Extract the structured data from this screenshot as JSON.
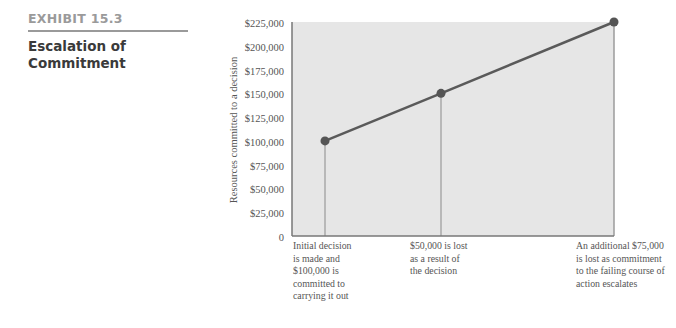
{
  "exhibit": {
    "label": "EXHIBIT 15.3",
    "title_line1": "Escalation of",
    "title_line2": "Commitment"
  },
  "chart_data": {
    "type": "line",
    "title": "Escalation of Commitment",
    "xlabel": "",
    "ylabel": "Resources committed to a decision",
    "ylim": [
      0,
      225000
    ],
    "yticks": [
      {
        "value": 225000,
        "label": "$225,000"
      },
      {
        "value": 200000,
        "label": "$200,000"
      },
      {
        "value": 175000,
        "label": "$175,000"
      },
      {
        "value": 150000,
        "label": "$150,000"
      },
      {
        "value": 125000,
        "label": "$125,000"
      },
      {
        "value": 100000,
        "label": "$100,000"
      },
      {
        "value": 75000,
        "label": "$75,000"
      },
      {
        "value": 50000,
        "label": "$50,000"
      },
      {
        "value": 25000,
        "label": "$25,000"
      },
      {
        "value": 0,
        "label": "0"
      }
    ],
    "grid": false,
    "points": [
      {
        "x_label": "Initial decision is made and $100,000 is committed to carrying it out",
        "value": 100000
      },
      {
        "x_label": "$50,000 is lost as a result of the decision",
        "value": 150000
      },
      {
        "x_label": "An additional $75,000 is lost as commitment to the failing course of action escalates",
        "value": 225000
      }
    ],
    "annotations": [
      [
        "Initial decision",
        "is made and",
        "$100,000 is",
        "committed to",
        "carrying it out"
      ],
      [
        "$50,000 is lost",
        "as a result of",
        "the decision"
      ],
      [
        "An additional $75,000",
        "is lost as commitment",
        "to the failing course of",
        "action escalates"
      ]
    ],
    "colors": {
      "plot_bg": "#e6e6e6",
      "line": "#5a5a5a",
      "marker": "#555555",
      "drop_line": "#8a8a8a"
    }
  }
}
